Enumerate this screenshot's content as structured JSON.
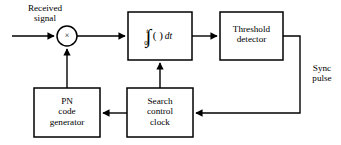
{
  "diagram": {
    "background_color": "#ffffff",
    "line_color": "#000000",
    "blocks": [
      {
        "id": "integrator",
        "name": "integrator-block",
        "label": "",
        "math": {
          "integral_symbol": "∫",
          "upper_limit": "t",
          "lower_limit": "0",
          "integrand": "( )",
          "differential": "dt"
        },
        "x": 128,
        "y": 12,
        "w": 64,
        "h": 48
      },
      {
        "id": "threshold_detector",
        "name": "threshold-detector-block",
        "label": "Threshold\ndetector",
        "x": 220,
        "y": 12,
        "w": 63,
        "h": 48
      },
      {
        "id": "pn_code_generator",
        "name": "pn-code-generator-block",
        "label": "PN\ncode\ngenerator",
        "x": 34,
        "y": 88,
        "w": 66,
        "h": 49
      },
      {
        "id": "search_control_clock",
        "name": "search-control-clock-block",
        "label": "Search\ncontrol\nclock",
        "x": 127,
        "y": 88,
        "w": 66,
        "h": 49
      }
    ],
    "multiplier": {
      "name": "multiplier-node",
      "symbol": "×",
      "cx": 67,
      "cy": 36,
      "r": 10
    },
    "free_labels": [
      {
        "id": "received_signal",
        "name": "received-signal-label",
        "text": "Received\nsignal",
        "x": 10,
        "y": 2,
        "w": 70
      },
      {
        "id": "sync_pulse",
        "name": "sync-pulse-label",
        "text": "Sync\npulse",
        "x": 303,
        "y": 63,
        "w": 38
      }
    ],
    "connections": [
      {
        "name": "input-to-multiplier",
        "from": "received-signal",
        "to": "multiplier"
      },
      {
        "name": "multiplier-to-integrator",
        "from": "multiplier",
        "to": "integrator"
      },
      {
        "name": "integrator-to-threshold-detector",
        "from": "integrator",
        "to": "threshold_detector"
      },
      {
        "name": "threshold-detector-to-search-control-clock",
        "from": "threshold_detector",
        "to": "search_control_clock"
      },
      {
        "name": "search-control-clock-to-pn-code-generator",
        "from": "search_control_clock",
        "to": "pn_code_generator"
      },
      {
        "name": "search-control-clock-to-integrator",
        "from": "search_control_clock",
        "to": "integrator"
      },
      {
        "name": "pn-code-generator-to-multiplier",
        "from": "pn_code_generator",
        "to": "multiplier"
      }
    ]
  }
}
